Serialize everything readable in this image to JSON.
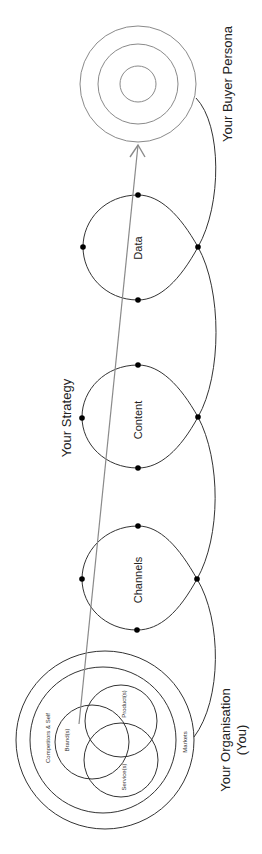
{
  "diagram": {
    "target": {
      "label": "Your Buyer Persona",
      "center": [
        138,
        84
      ],
      "rings": [
        58,
        40,
        18
      ],
      "ring_color": "#8a8a8a"
    },
    "strategy": {
      "label": "Your Strategy",
      "stages": [
        {
          "label": "Data",
          "center": [
            138,
            247
          ]
        },
        {
          "label": "Content",
          "center": [
            138,
            417
          ]
        },
        {
          "label": "Channels",
          "center": [
            138,
            579
          ]
        }
      ]
    },
    "organisation": {
      "label_line1": "Your Organisation",
      "label_line2": "(You)",
      "outer_rings": [
        {
          "label": "Competitors & Self"
        },
        {
          "label": "Markets"
        }
      ],
      "venn": [
        {
          "label": "Brand(s)"
        },
        {
          "label": "Product(s)"
        },
        {
          "label": "Service(s)"
        }
      ]
    },
    "arrow": {
      "from": [
        79,
        724
      ],
      "to": [
        138,
        144
      ],
      "color": "#8a8a8a"
    },
    "line_color": "#333333",
    "dot_color": "#000000"
  }
}
